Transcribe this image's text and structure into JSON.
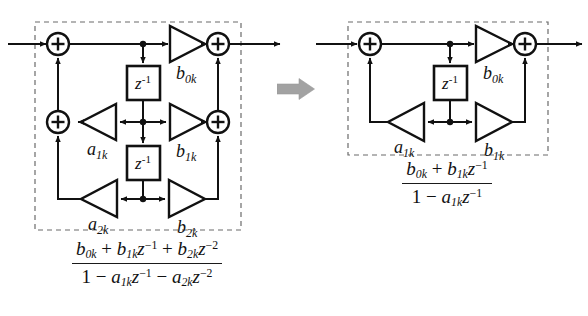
{
  "figure": {
    "background_color": "#ffffff",
    "line_color": "#111111",
    "dashed_border_color": "#6b6b6b",
    "arrow_color": "#9a9a9a"
  },
  "transform_arrow": {
    "name": "block-arrow-right",
    "direction": "right",
    "color": "#9e9e9e"
  },
  "left_diagram": {
    "label": "second-order-section",
    "dashed_box": {
      "x": 35,
      "y": 22,
      "width": 206,
      "height": 208
    },
    "nodes": {
      "input_arrow": "input",
      "output_arrow": "output",
      "adders": [
        {
          "name": "adder-top-left",
          "symbol": "+"
        },
        {
          "name": "adder-top-right",
          "symbol": "+"
        },
        {
          "name": "adder-mid-left",
          "symbol": "+"
        },
        {
          "name": "adder-mid-right",
          "symbol": "+"
        }
      ],
      "delays": [
        {
          "name": "delay-1",
          "label": "z",
          "exponent": "-1"
        },
        {
          "name": "delay-2",
          "label": "z",
          "exponent": "-1"
        }
      ],
      "gains": [
        {
          "name": "gain-b0k",
          "base": "b",
          "sub": "0k",
          "direction": "right"
        },
        {
          "name": "gain-b1k",
          "base": "b",
          "sub": "1k",
          "direction": "right"
        },
        {
          "name": "gain-b2k",
          "base": "b",
          "sub": "2k",
          "direction": "right"
        },
        {
          "name": "gain-a1k",
          "base": "a",
          "sub": "1k",
          "direction": "left"
        },
        {
          "name": "gain-a2k",
          "base": "a",
          "sub": "2k",
          "direction": "left"
        }
      ]
    },
    "transfer_function": {
      "numerator": "b0k + b1k z^-1 + b2k z^-2",
      "denominator": "1 - a1k z^-1 - a2k z^-2"
    }
  },
  "right_diagram": {
    "label": "first-order-section",
    "dashed_box": {
      "x": 54,
      "y": 22,
      "width": 200,
      "height": 133
    },
    "nodes": {
      "input_arrow": "input",
      "output_arrow": "output",
      "adders": [
        {
          "name": "adder-top-left",
          "symbol": "+"
        },
        {
          "name": "adder-top-right",
          "symbol": "+"
        }
      ],
      "delays": [
        {
          "name": "delay-1",
          "label": "z",
          "exponent": "-1"
        }
      ],
      "gains": [
        {
          "name": "gain-b0k",
          "base": "b",
          "sub": "0k",
          "direction": "right"
        },
        {
          "name": "gain-b1k",
          "base": "b",
          "sub": "1k",
          "direction": "right"
        },
        {
          "name": "gain-a1k",
          "base": "a",
          "sub": "1k",
          "direction": "left"
        }
      ]
    },
    "transfer_function": {
      "numerator": "b0k + b1k z^-1",
      "denominator": "1 - a1k z^-1"
    }
  },
  "symbols": {
    "plus": "+",
    "z": "z",
    "exp_m1": "-1",
    "exp_m2": "-2",
    "b": "b",
    "a": "a",
    "one": "1",
    "plus_op": "+",
    "minus_op": "−",
    "sub_0k": "0k",
    "sub_1k": "1k",
    "sub_2k": "2k"
  },
  "bottom_caption": "‌"
}
